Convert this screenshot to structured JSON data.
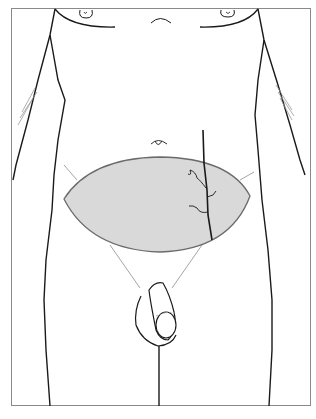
{
  "figure": {
    "type": "anatomical-illustration",
    "highlighted_region": "lower abdominal skin-fat ellipse (abdominoplasty excision area)",
    "annotations": [],
    "colors": {
      "frame": "#8a8a8a",
      "outline": "#1a1a1a",
      "highlight_fill": "#d9d9d9",
      "highlight_stroke": "#6a6a6a",
      "faint_lines": "#9a9a9a",
      "background": "#ffffff"
    }
  }
}
